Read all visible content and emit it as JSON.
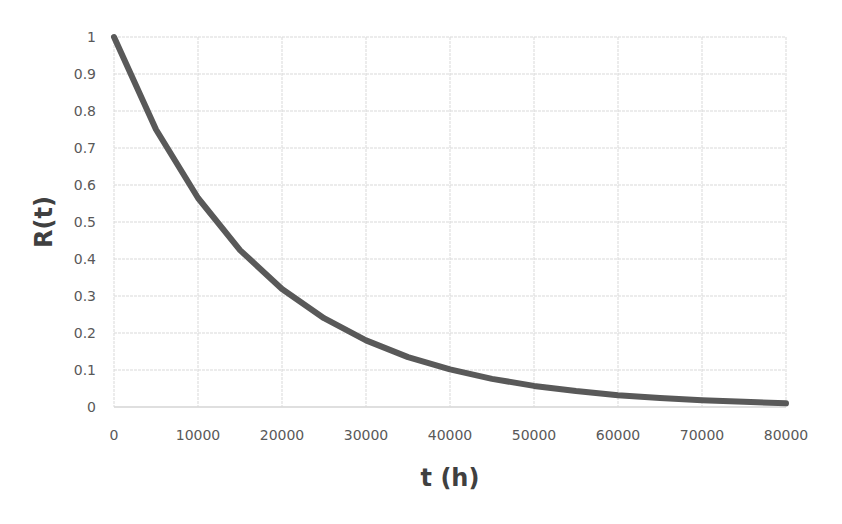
{
  "chart_data": {
    "type": "line",
    "title": "",
    "xlabel": "t (h)",
    "ylabel": "R(t)",
    "xlim": [
      0,
      80000
    ],
    "ylim": [
      0,
      1
    ],
    "x_ticks": [
      0,
      10000,
      20000,
      30000,
      40000,
      50000,
      60000,
      70000,
      80000
    ],
    "y_ticks": [
      0,
      0.1,
      0.2,
      0.3,
      0.4,
      0.5,
      0.6,
      0.7,
      0.8,
      0.9,
      1
    ],
    "x_tick_labels": [
      "0",
      "10000",
      "20000",
      "30000",
      "40000",
      "50000",
      "60000",
      "70000",
      "80000"
    ],
    "y_tick_labels": [
      "0",
      "0.1",
      "0.2",
      "0.3",
      "0.4",
      "0.5",
      "0.6",
      "0.7",
      "0.8",
      "0.9",
      "1"
    ],
    "grid": true,
    "legend": null,
    "series": [
      {
        "name": "R(t)",
        "color": "#595959",
        "x": [
          0,
          5000,
          10000,
          15000,
          20000,
          25000,
          30000,
          35000,
          40000,
          45000,
          50000,
          55000,
          60000,
          65000,
          70000,
          75000,
          80000
        ],
        "values": [
          1.0,
          0.75,
          0.565,
          0.424,
          0.319,
          0.24,
          0.18,
          0.135,
          0.102,
          0.076,
          0.057,
          0.043,
          0.032,
          0.024,
          0.018,
          0.014,
          0.01
        ]
      }
    ]
  },
  "colors": {
    "line": "#595959",
    "grid": "#d9d9d9",
    "axis": "#bfbfbf",
    "tick_text": "#595959",
    "title_text": "#404040"
  }
}
